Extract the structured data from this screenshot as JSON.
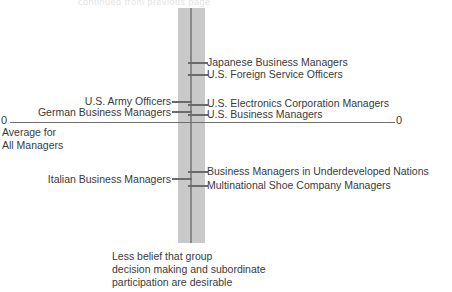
{
  "figure": {
    "top_cropped_fragment": "continued from previous page",
    "axis": {
      "left_zero_label": "0",
      "right_zero_label": "0",
      "baseline_note": "Average for\nAll Managers"
    },
    "caption": "Less belief that group\ndecision making and subordinate\nparticipation are desirable",
    "colors": {
      "band": "#c9c9c9",
      "center_rule": "#8a8a8a",
      "axis": "#6f6f6f",
      "tick": "#6b6b6b",
      "text": "#3a3a3a",
      "background": "#ffffff"
    }
  },
  "chart_data": {
    "type": "scatter",
    "title": "",
    "subtitle": "",
    "xlabel": "",
    "ylabel": "Belief that group decision making and subordinate participation are desirable",
    "axis_note_top": "",
    "axis_note_bottom": "Less belief that group decision making and subordinate participation are desirable",
    "baseline_label": "Average for All Managers",
    "baseline_value": 0,
    "zero_tick_labels": [
      "0",
      "0"
    ],
    "grid": false,
    "legend": "none",
    "ylim": [
      -3.2,
      3.2
    ],
    "orientation": "vertical-scale-with-side-labels",
    "points": [
      {
        "label": "Japanese Business Managers",
        "side": "right",
        "value": 3.0,
        "y_px": 62,
        "label_y_px": 56,
        "tick_style": "short-right"
      },
      {
        "label": "U.S. Foreign Service Officers",
        "side": "right",
        "value": 2.4,
        "y_px": 74,
        "label_y_px": 68,
        "tick_style": "short-right"
      },
      {
        "label": "U.S. Army Officers",
        "side": "left",
        "value": 1.1,
        "y_px": 101,
        "label_y_px": 95,
        "tick_style": "left-only"
      },
      {
        "label": "U.S. Electronics Corporation Managers",
        "side": "right",
        "value": 1.0,
        "y_px": 104,
        "label_y_px": 97,
        "tick_style": "short-right"
      },
      {
        "label": "German Business Managers",
        "side": "left",
        "value": 0.5,
        "y_px": 111,
        "label_y_px": 106,
        "tick_style": "left-only"
      },
      {
        "label": "U.S. Business Managers",
        "side": "right",
        "value": 0.4,
        "y_px": 114,
        "label_y_px": 108,
        "tick_style": "short-right"
      },
      {
        "label": "Business Managers in Underdeveloped Nations",
        "side": "right",
        "value": -2.0,
        "y_px": 171,
        "label_y_px": 165,
        "tick_style": "short-right"
      },
      {
        "label": "Italian Business Managers",
        "side": "left",
        "value": -2.4,
        "y_px": 178,
        "label_y_px": 173,
        "tick_style": "left-only"
      },
      {
        "label": "Multinational Shoe Company Managers",
        "side": "right",
        "value": -2.6,
        "y_px": 185,
        "label_y_px": 179,
        "tick_style": "short-right"
      }
    ]
  }
}
